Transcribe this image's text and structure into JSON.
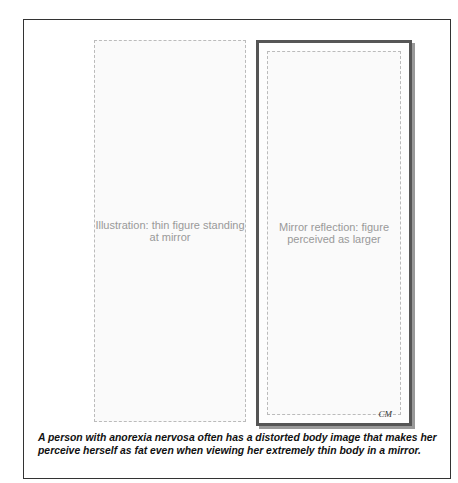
{
  "illustration": {
    "description_left": "Illustration: thin figure standing at mirror",
    "description_right": "Mirror reflection: figure perceived as larger",
    "signature": "CM"
  },
  "caption": {
    "line1": "A person with anorexia nervosa often has a distorted body image that makes her",
    "line2": "perceive herself as fat even when viewing her extremely thin body in a mirror."
  }
}
